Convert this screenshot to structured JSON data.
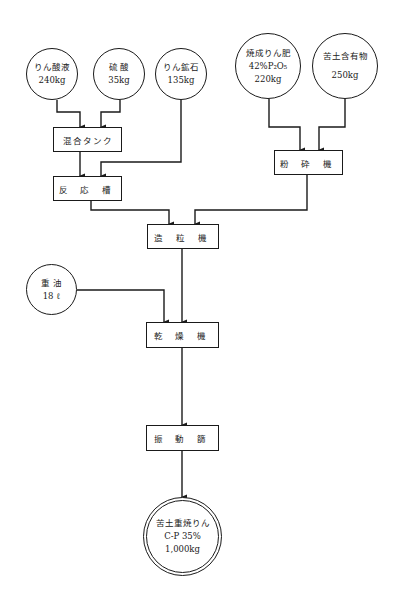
{
  "diagram": {
    "type": "process-flow",
    "inputs": [
      {
        "id": "phosphoric_acid",
        "name": "りん酸液",
        "amount": "240kg"
      },
      {
        "id": "sulfuric_acid",
        "name": "硫 酸",
        "amount": "35kg"
      },
      {
        "id": "phosphate_rock",
        "name": "りん鉱石",
        "amount": "135kg"
      },
      {
        "id": "calcined_phosphate",
        "name": "焼成りん肥",
        "spec": "42%P₂O₅",
        "amount": "220kg"
      },
      {
        "id": "magnesium_material",
        "name": "苦土含有物",
        "amount": "250kg"
      },
      {
        "id": "heavy_oil",
        "name": "重 油",
        "amount": "18 ℓ"
      }
    ],
    "processes": [
      {
        "id": "mixing_tank",
        "label": "混合タンク"
      },
      {
        "id": "reaction_tank",
        "label": "反 応 槽"
      },
      {
        "id": "crusher",
        "label": "粉 砕 機"
      },
      {
        "id": "granulator",
        "label": "造 粒 機"
      },
      {
        "id": "dryer",
        "label": "乾 燥 機"
      },
      {
        "id": "vibrating_screen",
        "label": "振 動 篩"
      }
    ],
    "output": {
      "id": "product",
      "name": "苦土重焼りん",
      "spec": "C-P 35%",
      "amount": "1,000kg"
    },
    "edges": [
      [
        "phosphoric_acid",
        "mixing_tank"
      ],
      [
        "sulfuric_acid",
        "mixing_tank"
      ],
      [
        "mixing_tank",
        "reaction_tank"
      ],
      [
        "phosphate_rock",
        "reaction_tank"
      ],
      [
        "calcined_phosphate",
        "crusher"
      ],
      [
        "magnesium_material",
        "crusher"
      ],
      [
        "reaction_tank",
        "granulator"
      ],
      [
        "crusher",
        "granulator"
      ],
      [
        "granulator",
        "dryer"
      ],
      [
        "heavy_oil",
        "dryer"
      ],
      [
        "dryer",
        "vibrating_screen"
      ],
      [
        "vibrating_screen",
        "product"
      ]
    ]
  },
  "colors": {
    "line": "#1a1a1a",
    "background": "#ffffff"
  }
}
